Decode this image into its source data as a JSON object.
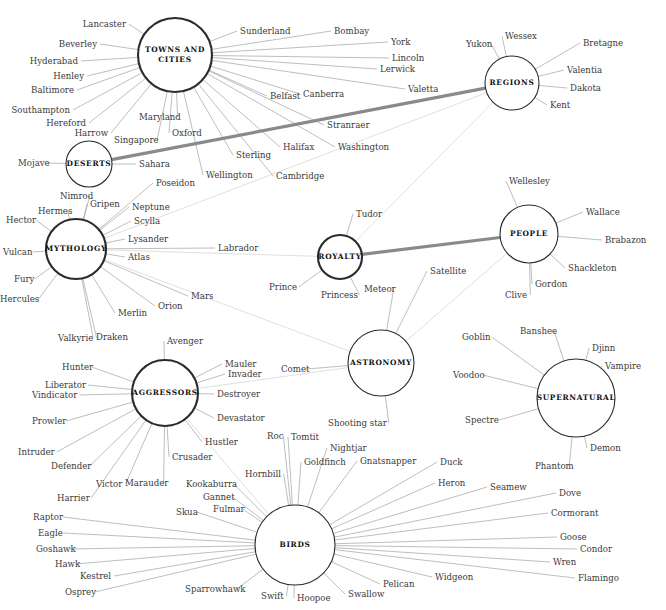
{
  "figure": {
    "kind": "network-diagram",
    "background": "#ffffff",
    "edge_color": "#9a9a9a",
    "edge_faint_color": "#c9c9c9",
    "edge_highlight_color": "#8a8a8a",
    "hub_stroke": "#2b2b2b",
    "label_color": "#3a3a3a"
  },
  "hubs": [
    {
      "id": "towns",
      "label": "TOWNS AND CITIES",
      "lines": [
        "TOWNS AND",
        "CITIES"
      ],
      "cx": 175,
      "cy": 55,
      "r": 37,
      "weight": "thick"
    },
    {
      "id": "regions",
      "label": "REGIONS",
      "lines": [
        "REGIONS"
      ],
      "cx": 512,
      "cy": 83,
      "r": 27,
      "weight": "thin"
    },
    {
      "id": "deserts",
      "label": "DESERTS",
      "lines": [
        "DESERTS"
      ],
      "cx": 89,
      "cy": 164,
      "r": 23,
      "weight": "thin"
    },
    {
      "id": "mythology",
      "label": "MYTHOLOGY",
      "lines": [
        "MYTHOLOGY"
      ],
      "cx": 76,
      "cy": 249,
      "r": 30,
      "weight": "thick"
    },
    {
      "id": "royalty",
      "label": "ROYALTY",
      "lines": [
        "ROYALTY"
      ],
      "cx": 340,
      "cy": 257,
      "r": 22,
      "weight": "thick"
    },
    {
      "id": "people",
      "label": "PEOPLE",
      "lines": [
        "PEOPLE"
      ],
      "cx": 529,
      "cy": 234,
      "r": 29,
      "weight": "thin"
    },
    {
      "id": "astronomy",
      "label": "ASTRONOMY",
      "lines": [
        "ASTRONOMY"
      ],
      "cx": 381,
      "cy": 363,
      "r": 33,
      "weight": "thin"
    },
    {
      "id": "supernatural",
      "label": "SUPERNATURAL",
      "lines": [
        "SUPERNATURAL"
      ],
      "cx": 576,
      "cy": 398,
      "r": 39,
      "weight": "thin"
    },
    {
      "id": "aggressors",
      "label": "AGGRESSORS",
      "lines": [
        "AGGRESSORS"
      ],
      "cx": 165,
      "cy": 393,
      "r": 33,
      "weight": "thick"
    },
    {
      "id": "birds",
      "label": "BIRDS",
      "lines": [
        "BIRDS"
      ],
      "cx": 295,
      "cy": 545,
      "r": 40,
      "weight": "thin"
    }
  ],
  "leaves": [
    {
      "text": "Lancaster",
      "x": 126,
      "y": 24,
      "anchor": "end",
      "hub": "towns"
    },
    {
      "text": "Beverley",
      "x": 97,
      "y": 44,
      "anchor": "end",
      "hub": "towns"
    },
    {
      "text": "Hyderabad",
      "x": 78,
      "y": 61,
      "anchor": "end",
      "hub": "towns"
    },
    {
      "text": "Henley",
      "x": 84,
      "y": 76,
      "anchor": "end",
      "hub": "towns"
    },
    {
      "text": "Baltimore",
      "x": 74,
      "y": 90,
      "anchor": "end",
      "hub": "towns"
    },
    {
      "text": "Southampton",
      "x": 70,
      "y": 110,
      "anchor": "end",
      "hub": "towns"
    },
    {
      "text": "Hereford",
      "x": 86,
      "y": 123,
      "anchor": "end",
      "hub": "towns"
    },
    {
      "text": "Harrow",
      "x": 108,
      "y": 133,
      "anchor": "end",
      "hub": "towns"
    },
    {
      "text": "Singapore",
      "x": 114,
      "y": 140,
      "anchor": "start",
      "hub": "towns"
    },
    {
      "text": "Maryland",
      "x": 139,
      "y": 117,
      "anchor": "start",
      "hub": "towns"
    },
    {
      "text": "Oxford",
      "x": 172,
      "y": 133,
      "anchor": "start",
      "hub": "towns"
    },
    {
      "text": "Wellington",
      "x": 206,
      "y": 175,
      "anchor": "start",
      "hub": "towns"
    },
    {
      "text": "Sterling",
      "x": 236,
      "y": 155,
      "anchor": "start",
      "hub": "towns"
    },
    {
      "text": "Cambridge",
      "x": 276,
      "y": 176,
      "anchor": "start",
      "hub": "towns"
    },
    {
      "text": "Halifax",
      "x": 283,
      "y": 147,
      "anchor": "start",
      "hub": "towns"
    },
    {
      "text": "Belfast",
      "x": 270,
      "y": 96,
      "anchor": "start",
      "hub": "towns"
    },
    {
      "text": "Stranraer",
      "x": 327,
      "y": 125,
      "anchor": "start",
      "hub": "towns"
    },
    {
      "text": "Canberra",
      "x": 303,
      "y": 94,
      "anchor": "start",
      "hub": "towns"
    },
    {
      "text": "Valetta",
      "x": 408,
      "y": 89,
      "anchor": "start",
      "hub": "towns"
    },
    {
      "text": "Lerwick",
      "x": 380,
      "y": 69,
      "anchor": "start",
      "hub": "towns"
    },
    {
      "text": "Lincoln",
      "x": 392,
      "y": 58,
      "anchor": "start",
      "hub": "towns"
    },
    {
      "text": "York",
      "x": 391,
      "y": 42,
      "anchor": "start",
      "hub": "towns"
    },
    {
      "text": "Bombay",
      "x": 334,
      "y": 31,
      "anchor": "start",
      "hub": "towns"
    },
    {
      "text": "Sunderland",
      "x": 240,
      "y": 31,
      "anchor": "start",
      "hub": "towns"
    },
    {
      "text": "Washington",
      "x": 338,
      "y": 147,
      "anchor": "start",
      "hub": "towns"
    },
    {
      "text": "Yukon",
      "x": 466,
      "y": 44,
      "anchor": "start",
      "hub": "regions"
    },
    {
      "text": "Wessex",
      "x": 505,
      "y": 36,
      "anchor": "start",
      "hub": "regions"
    },
    {
      "text": "Bretagne",
      "x": 583,
      "y": 43,
      "anchor": "start",
      "hub": "regions"
    },
    {
      "text": "Valentia",
      "x": 567,
      "y": 70,
      "anchor": "start",
      "hub": "regions"
    },
    {
      "text": "Dakota",
      "x": 570,
      "y": 88,
      "anchor": "start",
      "hub": "regions"
    },
    {
      "text": "Kent",
      "x": 550,
      "y": 105,
      "anchor": "start",
      "hub": "regions"
    },
    {
      "text": "Mojave",
      "x": 18,
      "y": 163,
      "anchor": "start",
      "hub": "deserts"
    },
    {
      "text": "Sahara",
      "x": 139,
      "y": 164,
      "anchor": "start",
      "hub": "deserts"
    },
    {
      "text": "Nimrod",
      "x": 60,
      "y": 196,
      "anchor": "start",
      "hub": "mythology"
    },
    {
      "text": "Gripen",
      "x": 90,
      "y": 204,
      "anchor": "start",
      "hub": "mythology"
    },
    {
      "text": "Hermes",
      "x": 38,
      "y": 211,
      "anchor": "start",
      "hub": "mythology"
    },
    {
      "text": "Hector",
      "x": 6,
      "y": 220,
      "anchor": "start",
      "hub": "mythology"
    },
    {
      "text": "Vulcan",
      "x": 3,
      "y": 252,
      "anchor": "start",
      "hub": "mythology"
    },
    {
      "text": "Fury",
      "x": 14,
      "y": 279,
      "anchor": "start",
      "hub": "mythology"
    },
    {
      "text": "Hercules",
      "x": 0,
      "y": 299,
      "anchor": "start",
      "hub": "mythology"
    },
    {
      "text": "Valkyrie",
      "x": 58,
      "y": 338,
      "anchor": "start",
      "hub": "mythology"
    },
    {
      "text": "Draken",
      "x": 96,
      "y": 337,
      "anchor": "start",
      "hub": "mythology"
    },
    {
      "text": "Merlin",
      "x": 118,
      "y": 313,
      "anchor": "start",
      "hub": "mythology"
    },
    {
      "text": "Orion",
      "x": 158,
      "y": 306,
      "anchor": "start",
      "hub": "mythology"
    },
    {
      "text": "Mars",
      "x": 191,
      "y": 296,
      "anchor": "start",
      "hub": "mythology"
    },
    {
      "text": "Atlas",
      "x": 128,
      "y": 257,
      "anchor": "start",
      "hub": "mythology"
    },
    {
      "text": "Lysander",
      "x": 128,
      "y": 239,
      "anchor": "start",
      "hub": "mythology"
    },
    {
      "text": "Scylla",
      "x": 134,
      "y": 221,
      "anchor": "start",
      "hub": "mythology"
    },
    {
      "text": "Neptune",
      "x": 132,
      "y": 207,
      "anchor": "start",
      "hub": "mythology"
    },
    {
      "text": "Poseidon",
      "x": 156,
      "y": 183,
      "anchor": "start",
      "hub": "mythology"
    },
    {
      "text": "Labrador",
      "x": 218,
      "y": 248,
      "anchor": "start",
      "hub": "mythology"
    },
    {
      "text": "Tudor",
      "x": 356,
      "y": 214,
      "anchor": "start",
      "hub": "royalty"
    },
    {
      "text": "Prince",
      "x": 269,
      "y": 287,
      "anchor": "start",
      "hub": "royalty"
    },
    {
      "text": "Princess",
      "x": 321,
      "y": 295,
      "anchor": "start",
      "hub": "royalty"
    },
    {
      "text": "Wellesley",
      "x": 509,
      "y": 181,
      "anchor": "start",
      "hub": "people"
    },
    {
      "text": "Wallace",
      "x": 586,
      "y": 212,
      "anchor": "start",
      "hub": "people"
    },
    {
      "text": "Brabazon",
      "x": 605,
      "y": 240,
      "anchor": "start",
      "hub": "people"
    },
    {
      "text": "Shackleton",
      "x": 568,
      "y": 268,
      "anchor": "start",
      "hub": "people"
    },
    {
      "text": "Gordon",
      "x": 535,
      "y": 284,
      "anchor": "start",
      "hub": "people"
    },
    {
      "text": "Clive",
      "x": 505,
      "y": 295,
      "anchor": "start",
      "hub": "people"
    },
    {
      "text": "Meteor",
      "x": 364,
      "y": 289,
      "anchor": "start",
      "hub": "astronomy"
    },
    {
      "text": "Satellite",
      "x": 430,
      "y": 271,
      "anchor": "start",
      "hub": "astronomy"
    },
    {
      "text": "Comet",
      "x": 281,
      "y": 369,
      "anchor": "start",
      "hub": "astronomy"
    },
    {
      "text": "Shooting star",
      "x": 328,
      "y": 423,
      "anchor": "start",
      "hub": "astronomy"
    },
    {
      "text": "Goblin",
      "x": 462,
      "y": 337,
      "anchor": "start",
      "hub": "supernatural"
    },
    {
      "text": "Banshee",
      "x": 520,
      "y": 331,
      "anchor": "start",
      "hub": "supernatural"
    },
    {
      "text": "Djinn",
      "x": 592,
      "y": 348,
      "anchor": "start",
      "hub": "supernatural"
    },
    {
      "text": "Vampire",
      "x": 605,
      "y": 366,
      "anchor": "start",
      "hub": "supernatural"
    },
    {
      "text": "Voodoo",
      "x": 453,
      "y": 375,
      "anchor": "start",
      "hub": "supernatural"
    },
    {
      "text": "Spectre",
      "x": 465,
      "y": 420,
      "anchor": "start",
      "hub": "supernatural"
    },
    {
      "text": "Demon",
      "x": 590,
      "y": 448,
      "anchor": "start",
      "hub": "supernatural"
    },
    {
      "text": "Phantom",
      "x": 535,
      "y": 466,
      "anchor": "start",
      "hub": "supernatural"
    },
    {
      "text": "Avenger",
      "x": 167,
      "y": 341,
      "anchor": "start",
      "hub": "aggressors"
    },
    {
      "text": "Mauler",
      "x": 225,
      "y": 364,
      "anchor": "start",
      "hub": "aggressors"
    },
    {
      "text": "Invader",
      "x": 228,
      "y": 374,
      "anchor": "start",
      "hub": "aggressors"
    },
    {
      "text": "Destroyer",
      "x": 217,
      "y": 394,
      "anchor": "start",
      "hub": "aggressors"
    },
    {
      "text": "Devastator",
      "x": 217,
      "y": 418,
      "anchor": "start",
      "hub": "aggressors"
    },
    {
      "text": "Hustler",
      "x": 205,
      "y": 442,
      "anchor": "start",
      "hub": "aggressors"
    },
    {
      "text": "Crusader",
      "x": 172,
      "y": 457,
      "anchor": "start",
      "hub": "aggressors"
    },
    {
      "text": "Marauder",
      "x": 125,
      "y": 483,
      "anchor": "start",
      "hub": "aggressors"
    },
    {
      "text": "Victor",
      "x": 96,
      "y": 484,
      "anchor": "start",
      "hub": "aggressors"
    },
    {
      "text": "Harrier",
      "x": 57,
      "y": 498,
      "anchor": "start",
      "hub": "aggressors"
    },
    {
      "text": "Defender",
      "x": 51,
      "y": 466,
      "anchor": "start",
      "hub": "aggressors"
    },
    {
      "text": "Intruder",
      "x": 18,
      "y": 452,
      "anchor": "start",
      "hub": "aggressors"
    },
    {
      "text": "Prowler",
      "x": 32,
      "y": 421,
      "anchor": "start",
      "hub": "aggressors"
    },
    {
      "text": "Vindicator",
      "x": 32,
      "y": 395,
      "anchor": "start",
      "hub": "aggressors"
    },
    {
      "text": "Liberator",
      "x": 45,
      "y": 385,
      "anchor": "start",
      "hub": "aggressors"
    },
    {
      "text": "Hunter",
      "x": 62,
      "y": 367,
      "anchor": "start",
      "hub": "aggressors"
    },
    {
      "text": "Raptor",
      "x": 33,
      "y": 517,
      "anchor": "start",
      "hub": "birds"
    },
    {
      "text": "Eagle",
      "x": 38,
      "y": 533,
      "anchor": "start",
      "hub": "birds"
    },
    {
      "text": "Goshawk",
      "x": 36,
      "y": 549,
      "anchor": "start",
      "hub": "birds"
    },
    {
      "text": "Hawk",
      "x": 55,
      "y": 564,
      "anchor": "start",
      "hub": "birds"
    },
    {
      "text": "Kestrel",
      "x": 80,
      "y": 576,
      "anchor": "start",
      "hub": "birds"
    },
    {
      "text": "Osprey",
      "x": 65,
      "y": 592,
      "anchor": "start",
      "hub": "birds"
    },
    {
      "text": "Sparrowhawk",
      "x": 185,
      "y": 589,
      "anchor": "start",
      "hub": "birds"
    },
    {
      "text": "Swift",
      "x": 261,
      "y": 596,
      "anchor": "start",
      "hub": "birds"
    },
    {
      "text": "Hoopoe",
      "x": 297,
      "y": 598,
      "anchor": "start",
      "hub": "birds"
    },
    {
      "text": "Swallow",
      "x": 348,
      "y": 594,
      "anchor": "start",
      "hub": "birds"
    },
    {
      "text": "Pelican",
      "x": 383,
      "y": 584,
      "anchor": "start",
      "hub": "birds"
    },
    {
      "text": "Widgeon",
      "x": 435,
      "y": 577,
      "anchor": "start",
      "hub": "birds"
    },
    {
      "text": "Flamingo",
      "x": 578,
      "y": 578,
      "anchor": "start",
      "hub": "birds"
    },
    {
      "text": "Wren",
      "x": 553,
      "y": 562,
      "anchor": "start",
      "hub": "birds"
    },
    {
      "text": "Condor",
      "x": 580,
      "y": 549,
      "anchor": "start",
      "hub": "birds"
    },
    {
      "text": "Goose",
      "x": 560,
      "y": 537,
      "anchor": "start",
      "hub": "birds"
    },
    {
      "text": "Cormorant",
      "x": 551,
      "y": 513,
      "anchor": "start",
      "hub": "birds"
    },
    {
      "text": "Dove",
      "x": 559,
      "y": 493,
      "anchor": "start",
      "hub": "birds"
    },
    {
      "text": "Seamew",
      "x": 490,
      "y": 487,
      "anchor": "start",
      "hub": "birds"
    },
    {
      "text": "Heron",
      "x": 438,
      "y": 483,
      "anchor": "start",
      "hub": "birds"
    },
    {
      "text": "Duck",
      "x": 440,
      "y": 462,
      "anchor": "start",
      "hub": "birds"
    },
    {
      "text": "Gnatsnapper",
      "x": 360,
      "y": 461,
      "anchor": "start",
      "hub": "birds"
    },
    {
      "text": "Nightjar",
      "x": 330,
      "y": 448,
      "anchor": "start",
      "hub": "birds"
    },
    {
      "text": "Goldfinch",
      "x": 304,
      "y": 462,
      "anchor": "start",
      "hub": "birds"
    },
    {
      "text": "Tomtit",
      "x": 291,
      "y": 437,
      "anchor": "start",
      "hub": "birds"
    },
    {
      "text": "Roc",
      "x": 267,
      "y": 436,
      "anchor": "start",
      "hub": "birds"
    },
    {
      "text": "Hornbill",
      "x": 245,
      "y": 474,
      "anchor": "start",
      "hub": "birds"
    },
    {
      "text": "Kookaburra",
      "x": 186,
      "y": 484,
      "anchor": "start",
      "hub": "birds"
    },
    {
      "text": "Gannet",
      "x": 203,
      "y": 497,
      "anchor": "start",
      "hub": "birds"
    },
    {
      "text": "Fulmar",
      "x": 213,
      "y": 509,
      "anchor": "start",
      "hub": "birds"
    },
    {
      "text": "Skua",
      "x": 176,
      "y": 512,
      "anchor": "start",
      "hub": "birds"
    }
  ],
  "highlight_edges": [
    {
      "from": "deserts",
      "to": "regions"
    },
    {
      "from": "royalty",
      "to": "people"
    }
  ],
  "cross_edges": [
    {
      "from": "regions",
      "to": "royalty"
    },
    {
      "from": "regions",
      "to": "mythology"
    },
    {
      "from": "people",
      "to": "royalty"
    },
    {
      "from": "people",
      "to": "astronomy"
    },
    {
      "from": "royalty",
      "to": "mythology"
    },
    {
      "from": "astronomy",
      "to": "mythology"
    },
    {
      "from": "astronomy",
      "to": "aggressors"
    },
    {
      "from": "birds",
      "to": "aggressors"
    }
  ]
}
